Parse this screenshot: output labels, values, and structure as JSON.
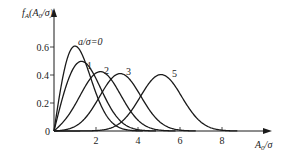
{
  "chart_data": {
    "type": "line",
    "title": "",
    "xlabel": "A0/σ",
    "ylabel": "fA(A0/σ)",
    "xlim": [
      0,
      9.2
    ],
    "ylim": [
      0,
      0.7
    ],
    "x_ticks": [
      "2",
      "4",
      "6",
      "8"
    ],
    "y_ticks": [
      "0",
      "0.2",
      "0.4",
      "0.6"
    ],
    "grid": false,
    "legend_position": "inline curve labels",
    "series": [
      {
        "name": "a/σ=0",
        "label": "a/σ=0",
        "a": 0
      },
      {
        "name": "1",
        "label": "1",
        "a": 1
      },
      {
        "name": "2",
        "label": "2",
        "a": 2
      },
      {
        "name": "3",
        "label": "3",
        "a": 3
      },
      {
        "name": "5",
        "label": "5",
        "a": 5
      }
    ],
    "approx_peaks": [
      {
        "series": "a/σ=0",
        "x": 1.0,
        "y": 0.61
      },
      {
        "series": "1",
        "x": 1.4,
        "y": 0.49
      },
      {
        "series": "2",
        "x": 2.2,
        "y": 0.42
      },
      {
        "series": "3",
        "x": 3.1,
        "y": 0.41
      },
      {
        "series": "5",
        "x": 5.1,
        "y": 0.4
      }
    ]
  },
  "axes": {
    "y_label_main": "f",
    "y_label_sub": "A",
    "y_label_rest": "(A",
    "y_label_sub2": "0",
    "y_label_end": "/σ)",
    "x_label_main": "A",
    "x_label_sub": "0",
    "x_label_end": "/σ",
    "origin": "0"
  },
  "colors": {
    "line": "#1a1a1a",
    "background": "#ffffff"
  }
}
